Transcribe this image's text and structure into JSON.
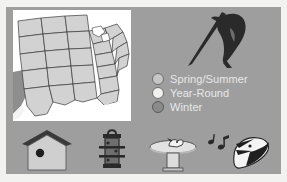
{
  "figure": {
    "panel_color": "#9e9e9e",
    "page_color": "#f2f2f0"
  },
  "map": {
    "name": "United States range map",
    "background_color": "#ffffff",
    "land_fill": "#d2d2d2",
    "outline_color": "#3a3a3a",
    "shaded_region_color": "#8e8e8e"
  },
  "legend": {
    "items": [
      {
        "label": "Spring/Summer",
        "color": "#c6c6c6",
        "border": "#6e6e6e"
      },
      {
        "label": "Year-Round",
        "color": "#f0f0ee",
        "border": "#6e6e6e"
      },
      {
        "label": "Winter",
        "color": "#8a8a8a",
        "border": "#5a5a5a"
      }
    ]
  },
  "illustrations": {
    "bird": {
      "name": "woodpecker-on-branch",
      "color": "#2a2a2a"
    }
  },
  "icons": [
    {
      "name": "birdhouse-icon",
      "label": "Birdhouse"
    },
    {
      "name": "bird-feeder-icon",
      "label": "Bird feeder"
    },
    {
      "name": "birdbath-icon",
      "label": "Birdbath"
    },
    {
      "name": "singing-bird-icon",
      "label": "Singing bird"
    }
  ]
}
